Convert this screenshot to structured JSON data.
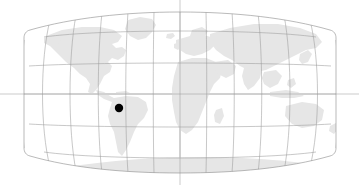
{
  "figure": {
    "name": "world-locator-map",
    "width": 359,
    "height": 185,
    "background_color": "#ffffff",
    "projection": "robinson",
    "title": "",
    "caption": ""
  },
  "style": {
    "land_fill": "#e6e6e6",
    "graticule_color": "#9a9a9a",
    "outline_color": "#8c8c8c",
    "marker_color": "#000000",
    "extend_line_color": "#a8a8a8"
  },
  "map": {
    "bounds": {
      "left_px": 24,
      "right_px": 336,
      "top_px": 12,
      "bottom_px": 173,
      "center_x_px": 180,
      "equator_y_px": 94
    },
    "graticule": {
      "parallels_deg": [
        75,
        60,
        45,
        30,
        15,
        0,
        -15,
        -30,
        -45,
        -60,
        -75
      ],
      "drawn_parallels_deg": [
        60,
        30,
        0,
        -30,
        -60
      ],
      "meridians_deg": [
        -180,
        -150,
        -120,
        -90,
        -60,
        -30,
        0,
        30,
        60,
        90,
        120,
        150,
        180
      ],
      "meridian_spacing_deg": 30,
      "parallel_spacing_deg": 30,
      "show_grid": true
    },
    "extended_axes": {
      "equator_extends_to_image_edges": true,
      "central_meridian_extends_to_image_edges": true
    },
    "markers": [
      {
        "id": "marker-1",
        "label": "",
        "lat": -15.0,
        "lon": -70.0,
        "x_px": 119,
        "y_px": 108,
        "radius_px": 4.2,
        "color": "#000000"
      }
    ],
    "landmasses": [
      "north-america",
      "south-america",
      "greenland",
      "africa",
      "europe",
      "asia",
      "australia",
      "antarctica",
      "madagascar",
      "indonesia",
      "japan",
      "new-zealand",
      "british-isles",
      "iceland"
    ]
  },
  "chart_data": {
    "type": "map",
    "title": "",
    "xlabel": "Longitude",
    "ylabel": "Latitude",
    "xlim": [
      -180,
      180
    ],
    "ylim": [
      -90,
      90
    ],
    "grid": true,
    "legend": "none",
    "projection": "robinson",
    "series": [
      {
        "name": "location-marker",
        "points": [
          {
            "lon": -70.0,
            "lat": -15.0
          }
        ]
      }
    ],
    "annotations": []
  }
}
